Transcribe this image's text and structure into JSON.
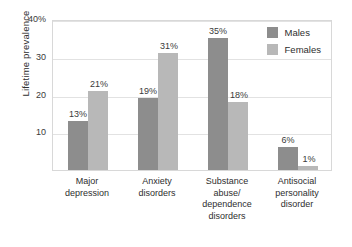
{
  "chart_data": {
    "type": "bar",
    "title": "",
    "xlabel": "",
    "ylabel": "Lifetime prevalence",
    "ylim": [
      0,
      40
    ],
    "grid": true,
    "legend_position": "top-right",
    "categories": [
      "Major depression",
      "Anxiety disorders",
      "Substance abuse/ dependence disorders",
      "Antisocial personality disorder"
    ],
    "category_lines": [
      [
        "Major",
        "depression"
      ],
      [
        "Anxiety",
        "disorders"
      ],
      [
        "Substance",
        "abuse/",
        "dependence",
        "disorders"
      ],
      [
        "Antisocial",
        "personality",
        "disorder"
      ]
    ],
    "series": [
      {
        "name": "Males",
        "color": "#8d8d8d",
        "values": [
          13,
          19,
          35,
          6
        ],
        "labels": [
          "13%",
          "19%",
          "35%",
          "6%"
        ]
      },
      {
        "name": "Females",
        "color": "#b8b8b8",
        "values": [
          21,
          31,
          18,
          1
        ],
        "labels": [
          "21%",
          "31%",
          "18%",
          "1%"
        ]
      }
    ],
    "yticks": [
      10,
      20,
      30,
      40
    ],
    "ytick_labels": [
      "10",
      "20",
      "30",
      "40%"
    ]
  },
  "axis": {
    "y_title": "Lifetime prevalence",
    "ticks": [
      {
        "value": 40,
        "label": "40%"
      },
      {
        "value": 30,
        "label": "30"
      },
      {
        "value": 20,
        "label": "20"
      },
      {
        "value": 10,
        "label": "10"
      }
    ]
  },
  "legend": {
    "items": [
      {
        "label": "Males",
        "color": "#8d8d8d"
      },
      {
        "label": "Females",
        "color": "#b8b8b8"
      }
    ]
  }
}
